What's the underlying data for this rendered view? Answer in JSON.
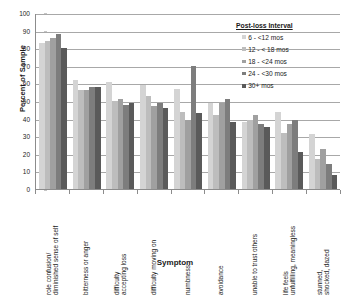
{
  "chart_data": {
    "type": "bar",
    "title": "",
    "xlabel": "Symptom",
    "ylabel": "Percent of Sample",
    "ylim": [
      0,
      100
    ],
    "ytick_step": 10,
    "yticks": [
      100,
      90,
      80,
      70,
      60,
      50,
      40,
      30,
      20,
      10,
      0
    ],
    "grid": true,
    "legend_position": "top-right",
    "legend_title": "Post-loss Interval",
    "categories": [
      "role confusion/diminished sense of self",
      "bitterness or anger",
      "difficulty accepting loss",
      "difficulty moving on",
      "numbness",
      "avoidance",
      "unable to trust others",
      "life feels unfulfilling, meaningless",
      "stunned, shocked, dazed"
    ],
    "series": [
      {
        "name": "6 - <12 mos",
        "color": "#d4d4d4",
        "values": [
          83,
          62,
          61,
          59,
          57,
          49,
          38,
          44,
          31
        ]
      },
      {
        "name": "12 - < 18 mos",
        "color": "#bdbdbd",
        "values": [
          84,
          56,
          50,
          53,
          44,
          42,
          39,
          32,
          17
        ]
      },
      {
        "name": "18 - <24 mos",
        "color": "#a0a0a0",
        "values": [
          86,
          56,
          51,
          47,
          39,
          49,
          42,
          37,
          23
        ]
      },
      {
        "name": "24 - <30 mos",
        "color": "#7d7d7d",
        "values": [
          88,
          58,
          48,
          49,
          70,
          51,
          37,
          39,
          14
        ]
      },
      {
        "name": "30+ mos",
        "color": "#5a5a5a",
        "values": [
          80,
          58,
          49,
          46,
          43,
          38,
          35,
          21,
          8
        ]
      }
    ]
  }
}
